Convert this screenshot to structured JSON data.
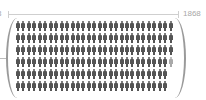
{
  "chart_data": {
    "type": "pictogram",
    "title": "",
    "start_label": "3",
    "end_label": "1868",
    "icon": "person-icon",
    "icon_color": "#555555",
    "rows": 6,
    "icons_per_row": [
      29,
      29,
      29,
      28.5,
      28,
      28
    ],
    "total_icons_approx": 171.5,
    "grid": false,
    "legend": null
  },
  "labels": {
    "left": "3",
    "right": "1868"
  }
}
